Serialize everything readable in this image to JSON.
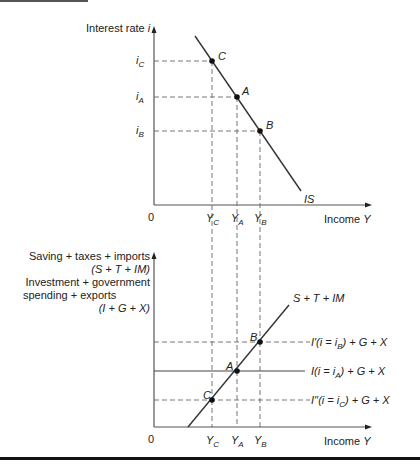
{
  "top_chart": {
    "y_axis_label": "Interest rate",
    "y_axis_symbol": "i",
    "x_axis_label": "Income",
    "x_axis_symbol": "Y",
    "origin": "0",
    "curve_label": "IS",
    "y_ticks": [
      {
        "base": "i",
        "sub": "C"
      },
      {
        "base": "i",
        "sub": "A"
      },
      {
        "base": "i",
        "sub": "B"
      }
    ],
    "x_ticks": [
      {
        "base": "Y",
        "sub": "C"
      },
      {
        "base": "Y",
        "sub": "A"
      },
      {
        "base": "Y",
        "sub": "B"
      }
    ],
    "points": [
      "C",
      "A",
      "B"
    ]
  },
  "bottom_chart": {
    "y_axis_label_lines": [
      "Saving + taxes + imports",
      "(S + T + IM)",
      "Investment + government",
      "spending + exports",
      "(I + G + X)"
    ],
    "x_axis_label": "Income",
    "x_axis_symbol": "Y",
    "origin": "0",
    "curve_label": "S + T + IM",
    "lines": [
      {
        "text": "I′(i = i",
        "sub": "B",
        "tail": ") + G + X"
      },
      {
        "text": "I(i = i",
        "sub": "A",
        "tail": ") + G + X"
      },
      {
        "text": "I′′(i = i",
        "sub": "C",
        "tail": ") + G + X"
      }
    ],
    "x_ticks": [
      {
        "base": "Y",
        "sub": "C"
      },
      {
        "base": "Y",
        "sub": "A"
      },
      {
        "base": "Y",
        "sub": "B"
      }
    ],
    "points": [
      "B",
      "A",
      "C"
    ]
  }
}
